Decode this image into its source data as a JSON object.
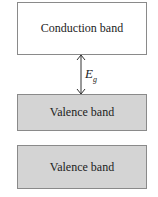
{
  "diagram": {
    "conduction_band": {
      "label": "Conduction band",
      "fill": "#ffffff"
    },
    "gap": {
      "symbol": "E",
      "subscript": "g"
    },
    "valence_band_upper": {
      "label": "Valence band",
      "fill": "#d4d4d4"
    },
    "valence_band_lower": {
      "label": "Valence band",
      "fill": "#d4d4d4"
    },
    "colors": {
      "border": "#8a8a8a",
      "text": "#222222"
    }
  }
}
